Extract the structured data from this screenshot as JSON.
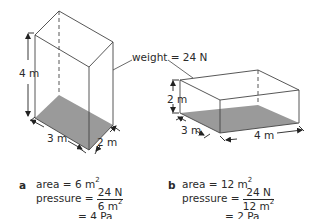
{
  "diagram": {
    "weight_label": "weight = 24 N",
    "box_a": {
      "height_label": "4 m",
      "length_label": "3 m",
      "width_label": "2 m",
      "base_fill": "#9a9a9a"
    },
    "box_b": {
      "height_label": "2 m",
      "width_label": "3 m",
      "length_label": "4 m",
      "base_fill": "#9a9a9a"
    }
  },
  "calculations": {
    "a": {
      "letter": "a",
      "area_prefix": "area = 6 m",
      "area_exp": "2",
      "pressure_prefix": "pressure =",
      "numerator": "24 N",
      "denominator_base": "6 m",
      "denominator_exp": "2",
      "result": "= 4 Pa"
    },
    "b": {
      "letter": "b",
      "area_prefix": "area = 12 m",
      "area_exp": "2",
      "pressure_prefix": "pressure =",
      "numerator": "24 N",
      "denominator_base": "12 m",
      "denominator_exp": "2",
      "result": "= 2 Pa"
    }
  }
}
